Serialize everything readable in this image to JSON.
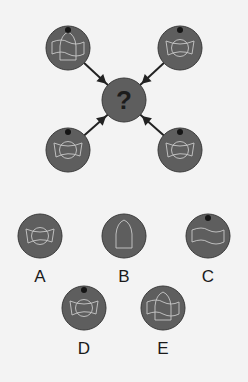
{
  "puzzle": {
    "center": {
      "symbol": "?",
      "cx": 124,
      "cy": 100,
      "r": 22
    },
    "sequence": [
      {
        "id": "top-left",
        "cx": 68,
        "cy": 48,
        "r": 22,
        "dot": true,
        "pattern": "bell-over-band"
      },
      {
        "id": "top-right",
        "cx": 180,
        "cy": 48,
        "r": 22,
        "dot": true,
        "pattern": "bowtie-with-circle"
      },
      {
        "id": "bottom-left",
        "cx": 68,
        "cy": 150,
        "r": 22,
        "dot": true,
        "pattern": "bowtie-with-circle"
      },
      {
        "id": "bottom-right",
        "cx": 180,
        "cy": 150,
        "r": 22,
        "dot": true,
        "pattern": "bowtie-with-circle"
      }
    ],
    "options": [
      {
        "label": "A",
        "cx": 40,
        "cy": 236,
        "r": 22,
        "dot": false,
        "pattern": "bowtie-with-circle"
      },
      {
        "label": "B",
        "cx": 124,
        "cy": 236,
        "r": 22,
        "dot": false,
        "pattern": "bell-only"
      },
      {
        "label": "C",
        "cx": 208,
        "cy": 236,
        "r": 22,
        "dot": true,
        "pattern": "band-only"
      },
      {
        "label": "D",
        "cx": 84,
        "cy": 308,
        "r": 22,
        "dot": true,
        "pattern": "bowtie-with-circle"
      },
      {
        "label": "E",
        "cx": 163,
        "cy": 308,
        "r": 22,
        "dot": false,
        "pattern": "bell-over-band"
      }
    ]
  },
  "colors": {
    "background": "#f3f3f3",
    "disc": "#5e5e5e",
    "disc_edge": "#3a3a3a",
    "line": "#c8c8c8",
    "dot": "#151515",
    "arrow": "#222222"
  }
}
